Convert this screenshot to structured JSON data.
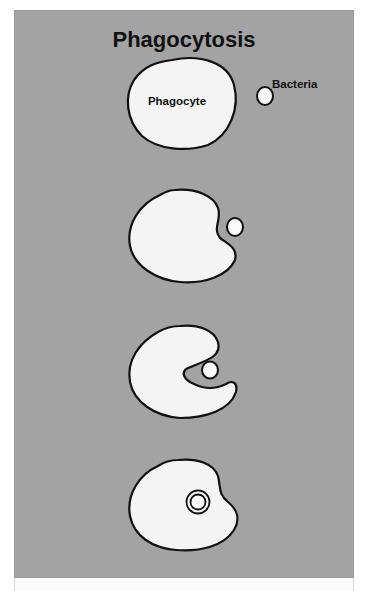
{
  "diagram": {
    "title": "Phagocytosis",
    "labels": {
      "phagocyte": "Phagocyte",
      "bacteria": "Bacteria"
    },
    "stages": [
      {
        "step": 1,
        "description": "Phagocyte approaches free bacterium"
      },
      {
        "step": 2,
        "description": "Phagocyte membrane indents toward bacterium"
      },
      {
        "step": 3,
        "description": "Pseudopods wrap around bacterium"
      },
      {
        "step": 4,
        "description": "Bacterium enclosed in phagosome inside cell"
      }
    ],
    "colors": {
      "background": "#a3a3a3",
      "cell_fill": "#f4f4f4",
      "outline": "#111111"
    }
  }
}
